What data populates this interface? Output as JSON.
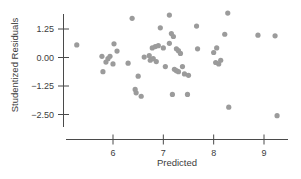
{
  "chart_data": {
    "type": "scatter",
    "title": "",
    "xlabel": "Predicted",
    "ylabel": "Studentized Residuals",
    "xticks": [
      6,
      7,
      8,
      9
    ],
    "xtick_labels": [
      "6",
      "7",
      "8",
      "9"
    ],
    "yticks": [
      1.25,
      0.0,
      -1.25,
      -2.5
    ],
    "ytick_labels": [
      "1.25",
      "0.00",
      "−1.25",
      "−2.50"
    ],
    "xlim": [
      5.1,
      9.6
    ],
    "ylim": [
      -3.05,
      2.05
    ],
    "grid": false,
    "legend": null,
    "point_color": "#9b9b9b",
    "axis_color": "#4a4a4a",
    "background": "#ffffff",
    "n_points": 54,
    "points": [
      {
        "x": 5.28,
        "y": 0.55
      },
      {
        "x": 5.78,
        "y": 0.05
      },
      {
        "x": 5.86,
        "y": -0.2
      },
      {
        "x": 5.9,
        "y": -0.05
      },
      {
        "x": 5.94,
        "y": 0.05
      },
      {
        "x": 6.0,
        "y": -0.28
      },
      {
        "x": 6.02,
        "y": 0.6
      },
      {
        "x": 6.08,
        "y": 0.28
      },
      {
        "x": 5.8,
        "y": -0.62
      },
      {
        "x": 6.38,
        "y": 1.72
      },
      {
        "x": 6.3,
        "y": -0.25
      },
      {
        "x": 6.5,
        "y": -0.82
      },
      {
        "x": 6.44,
        "y": -1.4
      },
      {
        "x": 6.46,
        "y": -1.55
      },
      {
        "x": 6.56,
        "y": -1.7
      },
      {
        "x": 6.72,
        "y": 0.08
      },
      {
        "x": 6.74,
        "y": -0.12
      },
      {
        "x": 6.78,
        "y": 0.42
      },
      {
        "x": 6.84,
        "y": 0.48
      },
      {
        "x": 6.9,
        "y": 0.52
      },
      {
        "x": 6.8,
        "y": -0.05
      },
      {
        "x": 6.86,
        "y": -0.18
      },
      {
        "x": 6.94,
        "y": 1.3
      },
      {
        "x": 7.0,
        "y": 0.42
      },
      {
        "x": 7.04,
        "y": -0.4
      },
      {
        "x": 7.12,
        "y": 1.86
      },
      {
        "x": 7.16,
        "y": 1.05
      },
      {
        "x": 7.2,
        "y": 0.92
      },
      {
        "x": 7.26,
        "y": 0.38
      },
      {
        "x": 7.3,
        "y": 0.3
      },
      {
        "x": 7.34,
        "y": 0.18
      },
      {
        "x": 7.22,
        "y": -0.52
      },
      {
        "x": 7.26,
        "y": -0.58
      },
      {
        "x": 7.3,
        "y": -0.62
      },
      {
        "x": 7.38,
        "y": -0.4
      },
      {
        "x": 7.18,
        "y": -1.62
      },
      {
        "x": 7.42,
        "y": -0.72
      },
      {
        "x": 7.5,
        "y": -0.78
      },
      {
        "x": 7.48,
        "y": -1.62
      },
      {
        "x": 7.66,
        "y": 1.38
      },
      {
        "x": 7.68,
        "y": 0.38
      },
      {
        "x": 8.0,
        "y": 0.22
      },
      {
        "x": 8.06,
        "y": 0.42
      },
      {
        "x": 8.04,
        "y": -0.22
      },
      {
        "x": 8.1,
        "y": -0.28
      },
      {
        "x": 8.14,
        "y": -0.12
      },
      {
        "x": 8.28,
        "y": 1.95
      },
      {
        "x": 8.22,
        "y": 1.02
      },
      {
        "x": 8.3,
        "y": -2.18
      },
      {
        "x": 8.88,
        "y": 0.98
      },
      {
        "x": 9.22,
        "y": 0.95
      },
      {
        "x": 9.26,
        "y": -2.55
      },
      {
        "x": 6.62,
        "y": 0.02
      },
      {
        "x": 7.12,
        "y": 0.62
      }
    ]
  }
}
